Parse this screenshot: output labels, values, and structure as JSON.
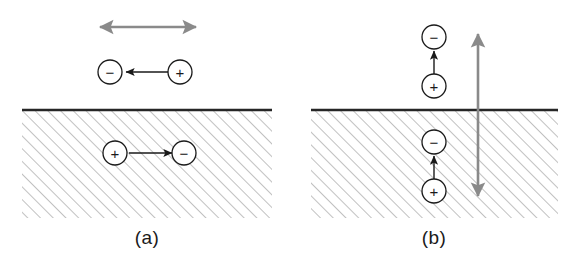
{
  "figure": {
    "background_color": "#ffffff",
    "width": 574,
    "height": 264
  },
  "style": {
    "charge_stroke": "#1a1a1a",
    "charge_fill": "#ffffff",
    "charge_radius": 12,
    "charge_stroke_width": 1.3,
    "sign_color": "#1a1a1a",
    "surface_line_color": "#262626",
    "surface_line_width": 2.6,
    "hatch_color": "#8c8c8c",
    "hatch_width": 1.1,
    "hatch_spacing": 9,
    "hatch_angle_deg": 45,
    "dipole_arrow_color": "#1a1a1a",
    "dipole_arrow_width": 1.4,
    "net_arrow_color": "#8a8a8a",
    "net_arrow_width": 2.6,
    "label_color": "#1a1a1a",
    "label_font_size": 19
  },
  "panels": [
    {
      "id": "a",
      "label": "(a)",
      "label_x": 147,
      "label_y": 238,
      "orientation": "horizontal",
      "description": "Horizontal dipole above surface with antiparallel image dipole below; net moment cancels",
      "substrate": {
        "name": "hatched-substrate",
        "x": 22,
        "y": 110,
        "width": 250,
        "height": 108
      },
      "surface_line": {
        "x1": 22,
        "y1": 110,
        "x2": 272,
        "y2": 110
      },
      "net_arrow": {
        "name": "net-dipole-arrow-horizontal",
        "x1": 100,
        "y1": 27,
        "x2": 196,
        "y2": 27,
        "double_headed": true,
        "direction": "horizontal"
      },
      "charges": [
        {
          "sign": "−",
          "name": "charge-minus-above",
          "cx": 110,
          "cy": 72,
          "region": "above"
        },
        {
          "sign": "+",
          "name": "charge-plus-above",
          "cx": 180,
          "cy": 72,
          "region": "above"
        },
        {
          "sign": "+",
          "name": "charge-plus-below",
          "cx": 115,
          "cy": 153,
          "region": "below"
        },
        {
          "sign": "−",
          "name": "charge-minus-below",
          "cx": 184,
          "cy": 153,
          "region": "below"
        }
      ],
      "dipole_arrows": [
        {
          "name": "dipole-arrow-above",
          "x1": 170,
          "y1": 72,
          "x2": 126,
          "y2": 72,
          "direction": "left"
        },
        {
          "name": "dipole-arrow-below",
          "x1": 129,
          "y1": 153,
          "x2": 172,
          "y2": 153,
          "direction": "right"
        }
      ]
    },
    {
      "id": "b",
      "label": "(b)",
      "label_x": 434,
      "label_y": 238,
      "orientation": "vertical",
      "description": "Vertical dipole above surface with parallel image dipole below; net moment adds",
      "substrate": {
        "name": "hatched-substrate",
        "x": 311,
        "y": 110,
        "width": 247,
        "height": 108
      },
      "surface_line": {
        "x1": 311,
        "y1": 110,
        "x2": 558,
        "y2": 110
      },
      "net_arrow": {
        "name": "net-dipole-arrow-vertical",
        "x1": 478,
        "y1": 196,
        "x2": 478,
        "y2": 34,
        "double_headed": true,
        "direction": "vertical"
      },
      "charges": [
        {
          "sign": "−",
          "name": "charge-minus-above",
          "cx": 434,
          "cy": 37,
          "region": "above"
        },
        {
          "sign": "+",
          "name": "charge-plus-above",
          "cx": 434,
          "cy": 86,
          "region": "above"
        },
        {
          "sign": "−",
          "name": "charge-minus-below",
          "cx": 434,
          "cy": 142,
          "region": "below"
        },
        {
          "sign": "+",
          "name": "charge-plus-below",
          "cx": 434,
          "cy": 191,
          "region": "below"
        }
      ],
      "dipole_arrows": [
        {
          "name": "dipole-arrow-above",
          "x1": 434,
          "y1": 74,
          "x2": 434,
          "y2": 51,
          "direction": "up"
        },
        {
          "name": "dipole-arrow-below",
          "x1": 434,
          "y1": 179,
          "x2": 434,
          "y2": 156,
          "direction": "up"
        }
      ]
    }
  ]
}
